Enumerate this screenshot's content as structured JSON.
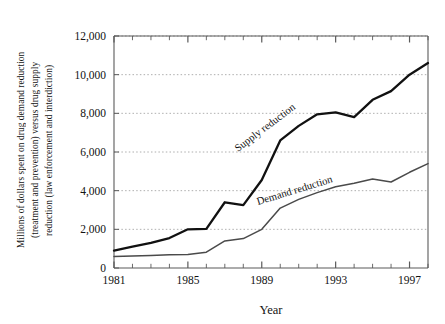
{
  "chart_data": {
    "type": "line",
    "title": "",
    "xlabel": "Year",
    "ylabel_lines": [
      "Millions of dollars spent on drug demand reduction",
      "(treatment and prevention) versus drug supply",
      "reduction (law enforcement and interdiction)"
    ],
    "x": [
      1981,
      1982,
      1983,
      1984,
      1985,
      1986,
      1987,
      1988,
      1989,
      1990,
      1991,
      1992,
      1993,
      1994,
      1995,
      1996,
      1997,
      1998
    ],
    "xlim": [
      1981,
      1998
    ],
    "ylim": [
      0,
      12000
    ],
    "xticks_major": [
      1981,
      1985,
      1989,
      1993,
      1997
    ],
    "xtick_labels": [
      "1981",
      "1985",
      "1989",
      "1993",
      "1997"
    ],
    "xticks_minor_all_years": true,
    "yticks": [
      0,
      2000,
      4000,
      6000,
      8000,
      10000,
      12000
    ],
    "ytick_labels": [
      "0",
      "2,000",
      "4,000",
      "6,000",
      "8,000",
      "10,000",
      "12,000"
    ],
    "grid": "horizontal-dotted",
    "legend_position": "inline-along-lines",
    "series": [
      {
        "name": "Supply reduction",
        "label": "Supply reduction",
        "color": "#111111",
        "width": 2.3,
        "label_rotation": -37,
        "label_x": 238,
        "label_y": 152,
        "values": [
          900,
          1100,
          1300,
          1550,
          2000,
          2020,
          3400,
          3250,
          4550,
          6600,
          7350,
          7950,
          8050,
          7800,
          8700,
          9150,
          10000,
          10600
        ]
      },
      {
        "name": "Demand reduction",
        "label": "Demand reduction",
        "color": "#4a4a4a",
        "width": 1.5,
        "label_rotation": -17,
        "label_x": 258,
        "label_y": 205,
        "values": [
          600,
          620,
          650,
          680,
          700,
          820,
          1400,
          1520,
          2000,
          3100,
          3550,
          3900,
          4200,
          4380,
          4600,
          4450,
          4950,
          5400
        ]
      }
    ]
  },
  "figure": {
    "plot_left": 114,
    "plot_right": 428,
    "plot_top": 36,
    "plot_bottom": 268,
    "background": "#ffffff",
    "frame_color": "#5a5a5a",
    "grid_color": "#9a9a9a"
  }
}
